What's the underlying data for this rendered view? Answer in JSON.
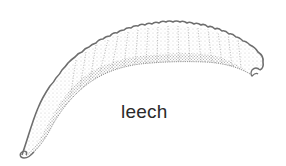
{
  "figure": {
    "subject": "leech",
    "label": "leech",
    "style": "stippled line drawing",
    "colors": {
      "outline": "#6e6e6e",
      "stipple": "#9a9a9a",
      "background": "#ffffff",
      "label": "#2a2a2a"
    }
  }
}
